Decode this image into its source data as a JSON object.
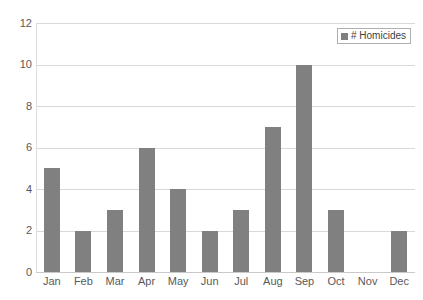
{
  "chart_data": {
    "type": "bar",
    "title": "",
    "xlabel": "",
    "ylabel": "",
    "categories": [
      "Jan",
      "Feb",
      "Mar",
      "Apr",
      "May",
      "Jun",
      "Jul",
      "Aug",
      "Sep",
      "Oct",
      "Nov",
      "Dec"
    ],
    "values": [
      5,
      2,
      3,
      6,
      4,
      2,
      3,
      7,
      10,
      3,
      0,
      2
    ],
    "series": [
      {
        "name": "# Homicides",
        "values": [
          5,
          2,
          3,
          6,
          4,
          2,
          3,
          7,
          10,
          3,
          0,
          2
        ]
      }
    ],
    "ylim": [
      0,
      12
    ],
    "ytick_values": [
      0,
      2,
      4,
      6,
      8,
      10,
      12
    ],
    "ytick_labels": [
      "0",
      "2",
      "4",
      "6",
      "8",
      "10",
      "12"
    ],
    "grid": "horizontal",
    "legend": {
      "position": "top-right",
      "entries": [
        {
          "label": "# Homicides",
          "color": "#808080",
          "marker": "square-swatch"
        }
      ]
    },
    "colors": {
      "bar_fill": "#808080",
      "gridline": "#d9d9d9",
      "axis_line": "#dedede",
      "tick_text": "#595959",
      "background": "#ffffff"
    }
  }
}
